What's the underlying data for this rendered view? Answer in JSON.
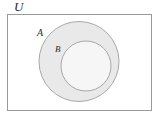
{
  "figure": {
    "kind": "venn-diagram",
    "caption": "",
    "background_color": "#ffffff",
    "width": 158,
    "height": 119
  },
  "universe": {
    "label": "U",
    "shape": "rectangle",
    "x": 7,
    "y": 14,
    "width": 144,
    "height": 96,
    "fill_color": "#ffffff",
    "stroke_color": "#9a9a9a",
    "stroke_width": 1,
    "label_x": 14,
    "label_y": 11
  },
  "sets": [
    {
      "name": "set-a",
      "label": "A",
      "shape": "circle",
      "cx": 79,
      "cy": 61.5,
      "r": 40,
      "fill_color": "#e9e9e9",
      "stroke_color": "#a8a8a8",
      "stroke_width": 1,
      "label_x": 37,
      "label_y": 36
    },
    {
      "name": "set-b",
      "label": "B",
      "shape": "circle",
      "cx": 86,
      "cy": 66,
      "r": 25,
      "fill_color": "#f6f6f6",
      "stroke_color": "#a8a8a8",
      "stroke_width": 1,
      "label_x": 55,
      "label_y": 52
    }
  ],
  "relationship": {
    "description": "B is a proper subset of A, and A is a subset of the universe U",
    "notation": "B ⊂ A ⊂ U"
  }
}
